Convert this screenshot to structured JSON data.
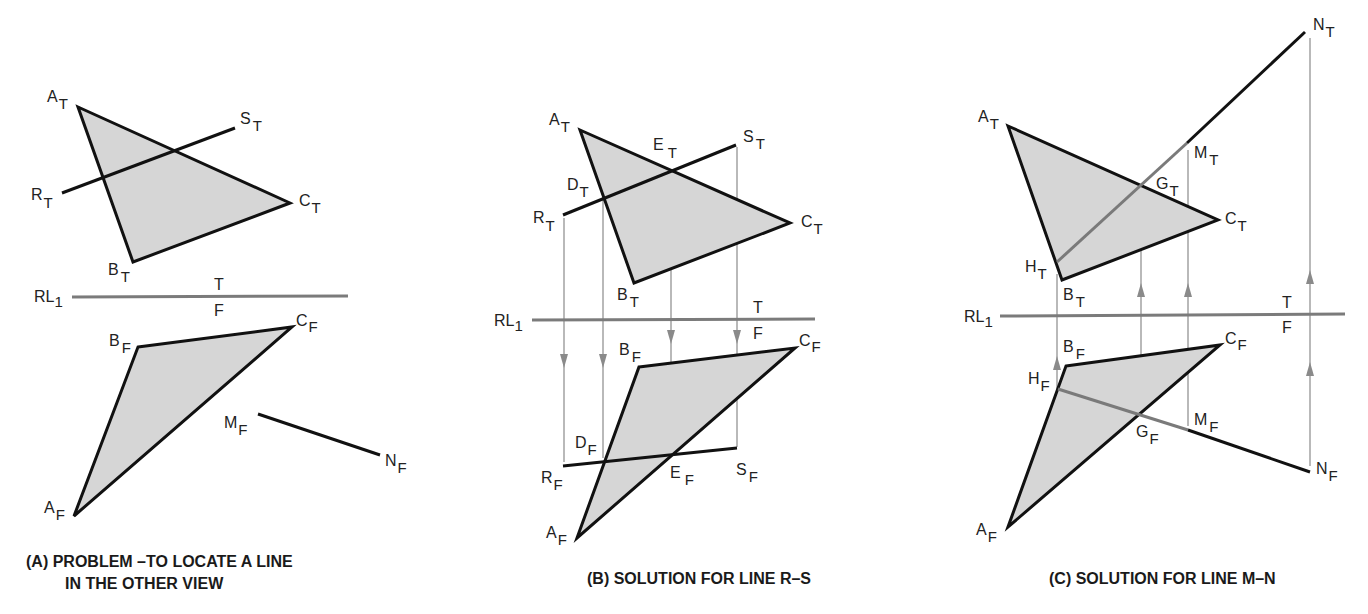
{
  "figure": {
    "panels": [
      {
        "id": "A",
        "caption_line1": "(A)  PROBLEM –TO LOCATE A LINE",
        "caption_line2": "IN THE OTHER VIEW",
        "labels": {
          "A_T": "A",
          "B_T": "B",
          "C_T": "C",
          "R_T": "R",
          "S_T": "S",
          "A_F": "A",
          "B_F": "B",
          "C_F": "C",
          "M_F": "M",
          "N_F": "N",
          "RL": "RL",
          "RL_sub": "1",
          "top": "T",
          "front": "F"
        }
      },
      {
        "id": "B",
        "caption": "(B)  SOLUTION FOR LINE R–S",
        "labels": {
          "A_T": "A",
          "B_T": "B",
          "C_T": "C",
          "R_T": "R",
          "S_T": "S",
          "D_T": "D",
          "E_T": "E",
          "A_F": "A",
          "B_F": "B",
          "C_F": "C",
          "R_F": "R",
          "S_F": "S",
          "D_F": "D",
          "E_F": "E",
          "RL": "RL",
          "RL_sub": "1",
          "top": "T",
          "front": "F"
        }
      },
      {
        "id": "C",
        "caption": "(C)  SOLUTION FOR LINE M–N",
        "labels": {
          "A_T": "A",
          "B_T": "B",
          "C_T": "C",
          "M_T": "M",
          "N_T": "N",
          "G_T": "G",
          "H_T": "H",
          "A_F": "A",
          "B_F": "B",
          "C_F": "C",
          "M_F": "M",
          "N_F": "N",
          "G_F": "G",
          "H_F": "H",
          "RL": "RL",
          "RL_sub": "1",
          "top": "T",
          "front": "F"
        }
      }
    ],
    "subscripts": {
      "top_view": "T",
      "front_view": "F"
    },
    "colors": {
      "plane_fill": "#d6d6d6",
      "visible_line": "#111111",
      "hidden_line": "#7a7a7a",
      "reference_line": "#7b7b7b",
      "projection_line": "#8a8a8a"
    }
  }
}
